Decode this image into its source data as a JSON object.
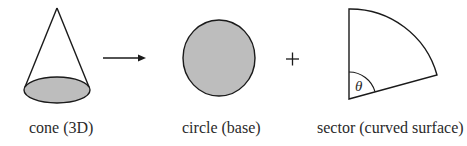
{
  "diagram": {
    "type": "decomposition",
    "colors": {
      "stroke": "#1a1a1a",
      "fill": "#bdbdbd",
      "background": "#ffffff"
    },
    "parts": [
      {
        "id": "cone",
        "label": "cone (3D)"
      },
      {
        "id": "circle",
        "label": "circle (base)"
      },
      {
        "id": "sector",
        "label": "sector (curved surface)",
        "angle_symbol": "θ"
      }
    ],
    "operators": {
      "arrow": "→",
      "plus": "+"
    }
  }
}
